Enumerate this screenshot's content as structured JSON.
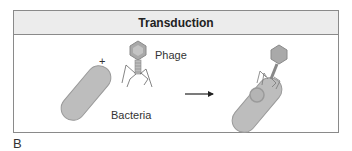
{
  "figure": {
    "title": "Transduction",
    "labels": {
      "bacteria": "Bacteria",
      "phage": "Phage",
      "plus": "+"
    },
    "panel_letter": "B",
    "colors": {
      "cell_fill": "#bdbdbd",
      "cell_stroke": "#9a9a9a",
      "phage_fill": "#a9a9a9",
      "border": "#8a8a8a",
      "header_bg": "#ececec"
    }
  }
}
